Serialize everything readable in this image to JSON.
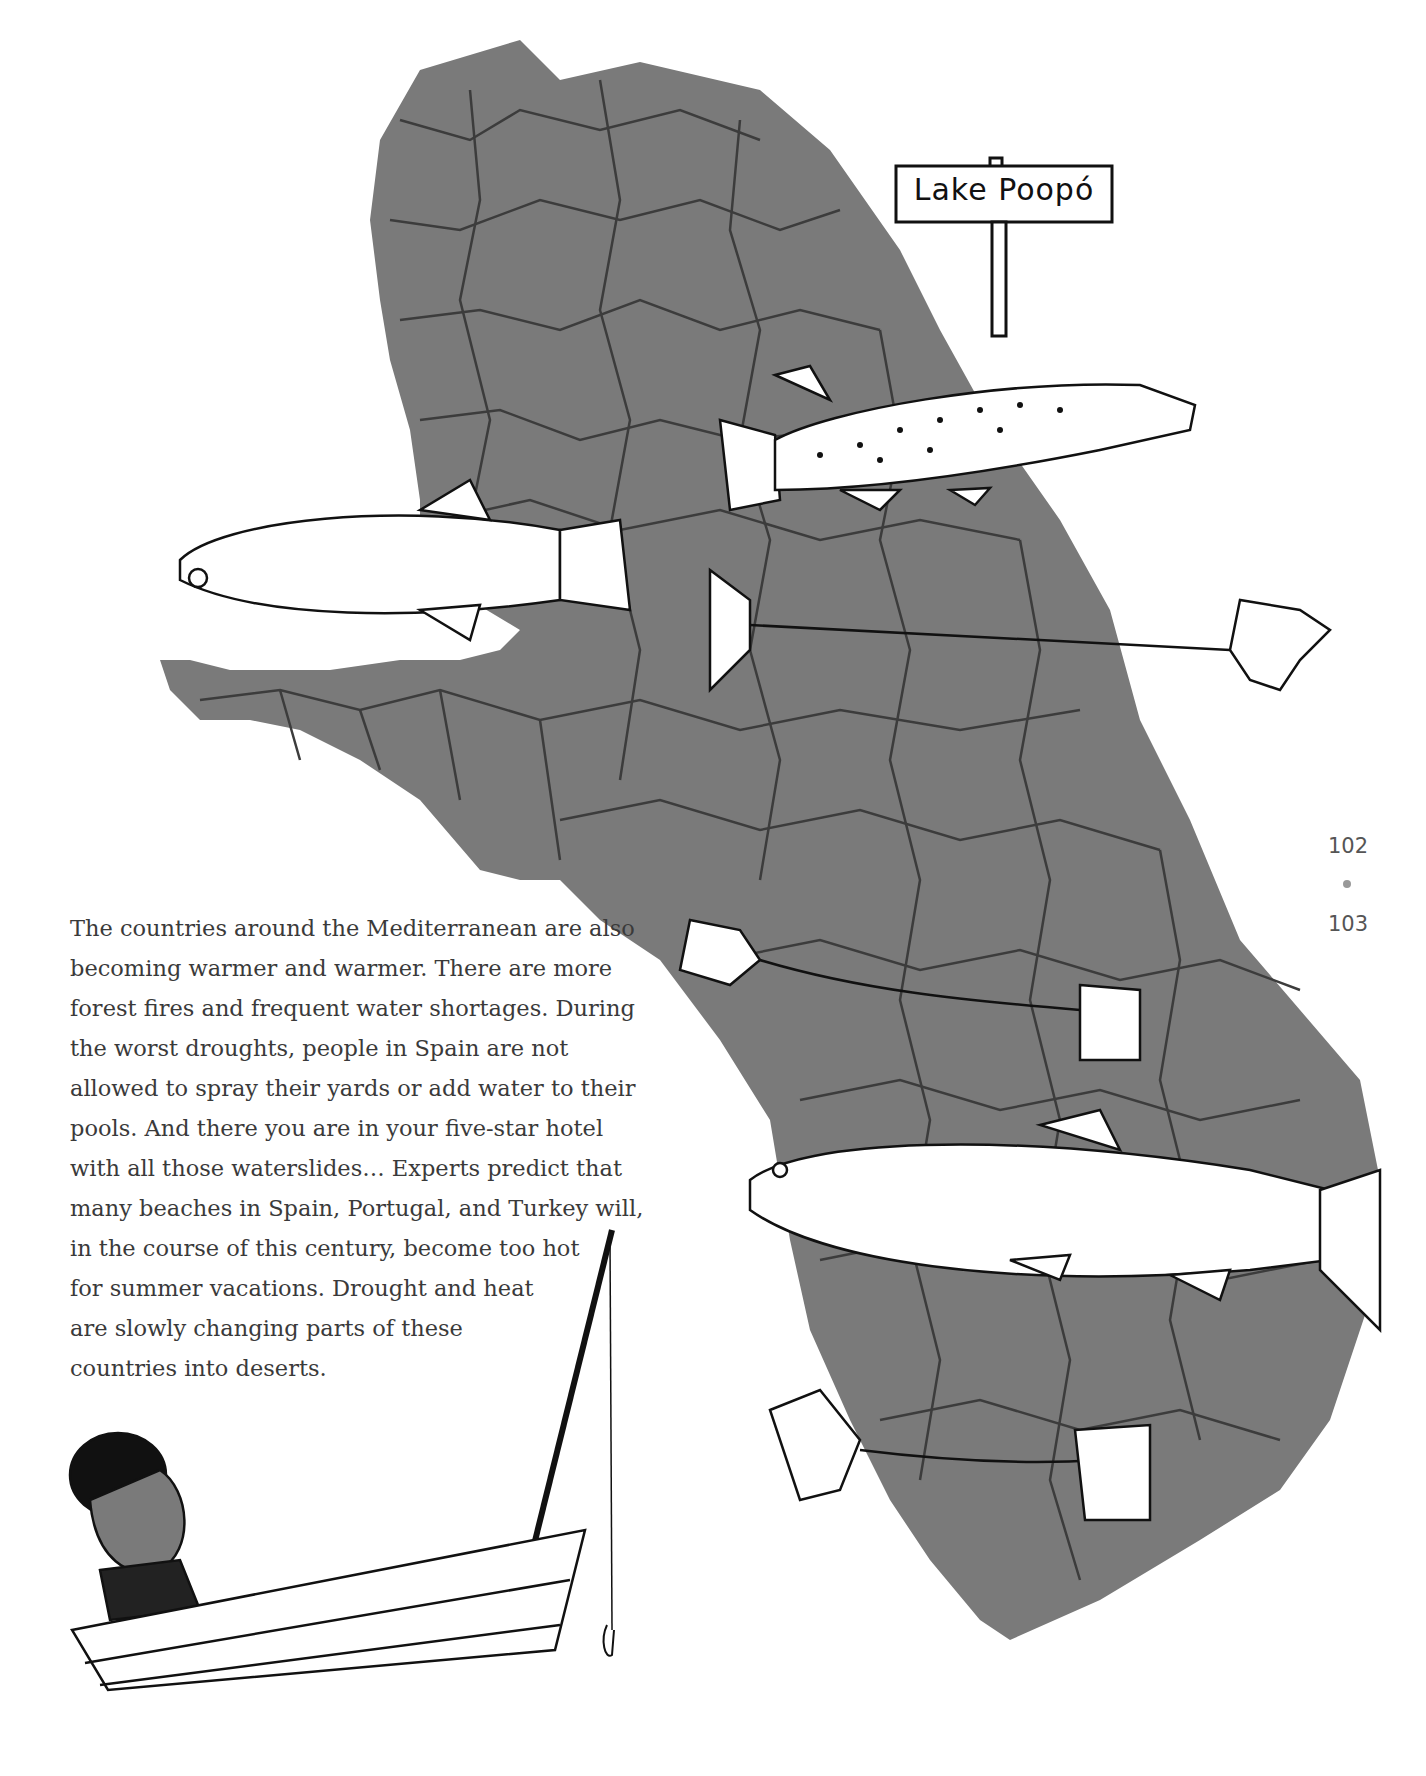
{
  "page": {
    "paragraph_lines": [
      "The countries around the Mediterranean are also",
      "becoming warmer and warmer. There are more",
      "forest fires and frequent water shortages. During",
      "the worst droughts, people in Spain are not",
      "allowed to spray their yards or add water to their",
      "pools. And there you are in your five-star hotel",
      "with all those waterslides… Experts predict that",
      "many beaches in Spain, Portugal, and Turkey will,",
      "in the course of this century, become too hot",
      "for summer vacations. Drought and heat",
      "are slowly changing parts of these",
      "countries into deserts."
    ],
    "page_numbers": {
      "left": "102",
      "right": "103"
    }
  },
  "illustration": {
    "sign_label": "Lake Poopó",
    "lake_color": "#7a7a7a",
    "crack_color": "#3c3c3c",
    "ink_color": "#111111",
    "elements": [
      "dried-lake-bed",
      "sign-post",
      "live-trout",
      "spotted-fish",
      "fish-skeleton",
      "fish-skeleton",
      "large-trout",
      "fish-skeleton",
      "man-in-boat",
      "fishing-rod"
    ]
  }
}
